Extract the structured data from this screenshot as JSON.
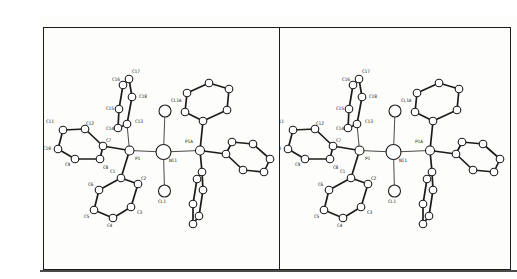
{
  "figure": {
    "kind": "stereo-pair-crystal-structure",
    "background": "#fdfdfc",
    "ink": "#1c1c1c",
    "border": {
      "x1": 3,
      "y1": 11,
      "x2": 470,
      "y2": 253,
      "divider_x": 239,
      "photo_edge_y": 255
    },
    "panels": [
      {
        "id": "left-stereo-view",
        "offset_x": 0,
        "clip": [
          4,
          12,
          235,
          240
        ]
      },
      {
        "id": "right-stereo-view",
        "offset_x": 230,
        "clip": [
          239,
          12,
          230,
          240
        ]
      }
    ]
  },
  "molecule": {
    "central_metal_label": "NI1",
    "atoms": [
      {
        "id": "NI1",
        "label": "NI1",
        "x": 123.5,
        "y": 136,
        "r": 7.5,
        "lx": 129,
        "ly": 146
      },
      {
        "id": "CL1A",
        "label": "CL1A",
        "x": 125,
        "y": 95,
        "r": 6,
        "lx": 131,
        "ly": 86
      },
      {
        "id": "CL1",
        "label": "CL1",
        "x": 124.5,
        "y": 175,
        "r": 6,
        "lx": 118,
        "ly": 187
      },
      {
        "id": "P1",
        "label": "P1",
        "x": 89.5,
        "y": 134.5,
        "r": 4.5,
        "lx": 95,
        "ly": 144
      },
      {
        "id": "P1A",
        "label": "P1A",
        "x": 160,
        "y": 134.5,
        "r": 4.5,
        "lx": 145,
        "ly": 127
      },
      {
        "id": "C1",
        "label": "C1",
        "x": 81,
        "y": 162,
        "r": 3.8,
        "lx": 70,
        "ly": 157
      },
      {
        "id": "C2",
        "label": "C2",
        "x": 98,
        "y": 168,
        "r": 3.8,
        "lx": 101,
        "ly": 164
      },
      {
        "id": "C3",
        "label": "C3",
        "x": 91,
        "y": 191,
        "r": 3.8,
        "lx": 97,
        "ly": 198
      },
      {
        "id": "C4",
        "label": "C4",
        "x": 73,
        "y": 202,
        "r": 3.8,
        "lx": 67,
        "ly": 211
      },
      {
        "id": "C5",
        "label": "C5",
        "x": 54,
        "y": 194,
        "r": 3.8,
        "lx": 44,
        "ly": 202
      },
      {
        "id": "C6",
        "label": "C6",
        "x": 59,
        "y": 174,
        "r": 3.8,
        "lx": 48,
        "ly": 170
      },
      {
        "id": "C7",
        "label": "C7",
        "x": 63,
        "y": 130,
        "r": 3.8,
        "lx": 66,
        "ly": 126
      },
      {
        "id": "C8",
        "label": "C8",
        "x": 60,
        "y": 143,
        "r": 3.8,
        "lx": 63,
        "ly": 153
      },
      {
        "id": "C9",
        "label": "C9",
        "x": 35,
        "y": 143,
        "r": 3.8,
        "lx": 25,
        "ly": 150
      },
      {
        "id": "C10",
        "label": "C10",
        "x": 18,
        "y": 133,
        "r": 3.8,
        "lx": 3,
        "ly": 134
      },
      {
        "id": "C11",
        "label": "C11",
        "x": 23,
        "y": 114,
        "r": 3.8,
        "lx": 6,
        "ly": 107
      },
      {
        "id": "C12",
        "label": "C12",
        "x": 45,
        "y": 113,
        "r": 3.8,
        "lx": 46,
        "ly": 109
      },
      {
        "id": "C13",
        "label": "C13",
        "x": 87,
        "y": 108,
        "r": 3.8,
        "lx": 95,
        "ly": 107
      },
      {
        "id": "C14",
        "label": "C14",
        "x": 78,
        "y": 112,
        "r": 3.8,
        "lx": 66,
        "ly": 114
      },
      {
        "id": "C15",
        "label": "C15",
        "x": 79,
        "y": 93,
        "r": 3.8,
        "lx": 66,
        "ly": 94
      },
      {
        "id": "C16",
        "label": "C16",
        "x": 83,
        "y": 69,
        "r": 3.8,
        "lx": 72,
        "ly": 65
      },
      {
        "id": "C17",
        "label": "C17",
        "x": 89,
        "y": 63,
        "r": 3.8,
        "lx": 92,
        "ly": 57
      },
      {
        "id": "C18",
        "label": "C18",
        "x": 92,
        "y": 81,
        "r": 3.8,
        "lx": 99,
        "ly": 82
      },
      {
        "id": "D1",
        "label": "",
        "x": 163,
        "y": 105,
        "r": 3.8,
        "lx": 0,
        "ly": 0
      },
      {
        "id": "D2",
        "label": "",
        "x": 145,
        "y": 96,
        "r": 3.8,
        "lx": 0,
        "ly": 0
      },
      {
        "id": "D3",
        "label": "",
        "x": 147,
        "y": 77,
        "r": 3.8,
        "lx": 0,
        "ly": 0
      },
      {
        "id": "D4",
        "label": "",
        "x": 169,
        "y": 67,
        "r": 3.8,
        "lx": 0,
        "ly": 0
      },
      {
        "id": "D5",
        "label": "",
        "x": 189,
        "y": 73,
        "r": 3.8,
        "lx": 0,
        "ly": 0
      },
      {
        "id": "D6",
        "label": "",
        "x": 187,
        "y": 94,
        "r": 3.8,
        "lx": 0,
        "ly": 0
      },
      {
        "id": "E1",
        "label": "",
        "x": 186,
        "y": 138,
        "r": 3.8,
        "lx": 0,
        "ly": 0
      },
      {
        "id": "E2",
        "label": "",
        "x": 192,
        "y": 126,
        "r": 3.8,
        "lx": 0,
        "ly": 0
      },
      {
        "id": "E3",
        "label": "",
        "x": 213,
        "y": 128,
        "r": 3.8,
        "lx": 0,
        "ly": 0
      },
      {
        "id": "E4",
        "label": "",
        "x": 230,
        "y": 143,
        "r": 3.8,
        "lx": 0,
        "ly": 0
      },
      {
        "id": "E5",
        "label": "",
        "x": 224,
        "y": 156,
        "r": 3.8,
        "lx": 0,
        "ly": 0
      },
      {
        "id": "E6",
        "label": "",
        "x": 203,
        "y": 154,
        "r": 3.8,
        "lx": 0,
        "ly": 0
      },
      {
        "id": "F1",
        "label": "",
        "x": 162,
        "y": 156,
        "r": 3.8,
        "lx": 0,
        "ly": 0
      },
      {
        "id": "F2",
        "label": "",
        "x": 163,
        "y": 174,
        "r": 3.8,
        "lx": 0,
        "ly": 0
      },
      {
        "id": "F3",
        "label": "",
        "x": 159,
        "y": 200,
        "r": 3.8,
        "lx": 0,
        "ly": 0
      },
      {
        "id": "F4",
        "label": "",
        "x": 153,
        "y": 208,
        "r": 3.8,
        "lx": 0,
        "ly": 0
      },
      {
        "id": "F5",
        "label": "",
        "x": 153,
        "y": 188,
        "r": 3.8,
        "lx": 0,
        "ly": 0
      },
      {
        "id": "F6",
        "label": "",
        "x": 157,
        "y": 163,
        "r": 3.8,
        "lx": 0,
        "ly": 0
      }
    ],
    "bonds": [
      {
        "a": "NI1",
        "b": "P1",
        "w": "thin"
      },
      {
        "a": "NI1",
        "b": "P1A",
        "w": "thin"
      },
      {
        "a": "NI1",
        "b": "CL1A",
        "w": "thin"
      },
      {
        "a": "NI1",
        "b": "CL1",
        "w": "thin"
      },
      {
        "a": "P1",
        "b": "C1",
        "w": "thick"
      },
      {
        "a": "P1",
        "b": "C7",
        "w": "thick"
      },
      {
        "a": "P1",
        "b": "C13",
        "w": "thin"
      },
      {
        "a": "P1A",
        "b": "D1",
        "w": "thick"
      },
      {
        "a": "P1A",
        "b": "E1",
        "w": "thick"
      },
      {
        "a": "P1A",
        "b": "F1",
        "w": "thick"
      },
      {
        "a": "C1",
        "b": "C2",
        "w": "thick"
      },
      {
        "a": "C2",
        "b": "C3",
        "w": "thick"
      },
      {
        "a": "C3",
        "b": "C4",
        "w": "thick"
      },
      {
        "a": "C4",
        "b": "C5",
        "w": "thick"
      },
      {
        "a": "C5",
        "b": "C6",
        "w": "thick"
      },
      {
        "a": "C6",
        "b": "C1",
        "w": "thick"
      },
      {
        "a": "C7",
        "b": "C8",
        "w": "thick"
      },
      {
        "a": "C8",
        "b": "C9",
        "w": "thick"
      },
      {
        "a": "C9",
        "b": "C10",
        "w": "thick"
      },
      {
        "a": "C10",
        "b": "C11",
        "w": "thick"
      },
      {
        "a": "C11",
        "b": "C12",
        "w": "thick"
      },
      {
        "a": "C12",
        "b": "C7",
        "w": "thick"
      },
      {
        "a": "C13",
        "b": "C14",
        "w": "thick"
      },
      {
        "a": "C14",
        "b": "C15",
        "w": "thick"
      },
      {
        "a": "C15",
        "b": "C16",
        "w": "thick"
      },
      {
        "a": "C16",
        "b": "C17",
        "w": "thick"
      },
      {
        "a": "C17",
        "b": "C18",
        "w": "thick"
      },
      {
        "a": "C18",
        "b": "C13",
        "w": "thick"
      },
      {
        "a": "D1",
        "b": "D2",
        "w": "thick"
      },
      {
        "a": "D2",
        "b": "D3",
        "w": "thick"
      },
      {
        "a": "D3",
        "b": "D4",
        "w": "thick"
      },
      {
        "a": "D4",
        "b": "D5",
        "w": "thick"
      },
      {
        "a": "D5",
        "b": "D6",
        "w": "thick"
      },
      {
        "a": "D6",
        "b": "D1",
        "w": "thick"
      },
      {
        "a": "E1",
        "b": "E2",
        "w": "thick"
      },
      {
        "a": "E2",
        "b": "E3",
        "w": "thick"
      },
      {
        "a": "E3",
        "b": "E4",
        "w": "thick"
      },
      {
        "a": "E4",
        "b": "E5",
        "w": "thick"
      },
      {
        "a": "E5",
        "b": "E6",
        "w": "thick"
      },
      {
        "a": "E6",
        "b": "E1",
        "w": "thick"
      },
      {
        "a": "F1",
        "b": "F2",
        "w": "thick"
      },
      {
        "a": "F2",
        "b": "F3",
        "w": "thick"
      },
      {
        "a": "F3",
        "b": "F4",
        "w": "thick"
      },
      {
        "a": "F4",
        "b": "F5",
        "w": "thick"
      },
      {
        "a": "F5",
        "b": "F6",
        "w": "thick"
      },
      {
        "a": "F6",
        "b": "F1",
        "w": "thick"
      }
    ]
  }
}
